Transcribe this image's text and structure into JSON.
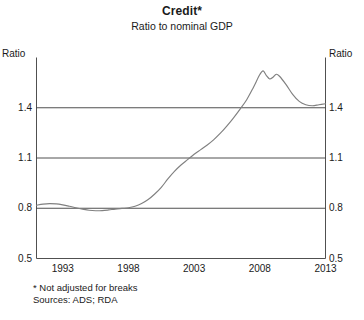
{
  "chart_data": {
    "type": "line",
    "title": "Credit*",
    "subtitle": "Ratio to nominal GDP",
    "xlabel": "",
    "ylabel": "Ratio",
    "ylabel_right": "Ratio",
    "xlim": [
      1991,
      2013
    ],
    "ylim": [
      0.5,
      1.7
    ],
    "yticks": [
      0.5,
      0.8,
      1.1,
      1.4
    ],
    "ytick_labels": [
      "0.5",
      "0.8",
      "1.1",
      "1.4"
    ],
    "xticks": [
      1993,
      1998,
      2003,
      2008,
      2013
    ],
    "xtick_labels": [
      "1993",
      "1998",
      "2003",
      "2008",
      "2013"
    ],
    "grid": "horizontal",
    "legend": "none",
    "line_color": "#808080",
    "axis_color": "#3c3c3c",
    "series": [
      {
        "name": "Credit to nominal GDP",
        "x": [
          1991.0,
          1991.5,
          1992.0,
          1992.5,
          1993.0,
          1993.5,
          1994.0,
          1994.5,
          1995.0,
          1995.5,
          1996.0,
          1996.5,
          1997.0,
          1997.5,
          1998.0,
          1998.5,
          1999.0,
          1999.5,
          2000.0,
          2000.5,
          2001.0,
          2001.5,
          2002.0,
          2002.5,
          2003.0,
          2003.5,
          2004.0,
          2004.5,
          2005.0,
          2005.5,
          2006.0,
          2006.5,
          2007.0,
          2007.5,
          2008.0,
          2008.25,
          2008.5,
          2008.75,
          2009.0,
          2009.25,
          2009.5,
          2010.0,
          2010.5,
          2011.0,
          2011.5,
          2012.0,
          2012.5,
          2013.0
        ],
        "y": [
          0.818,
          0.825,
          0.828,
          0.826,
          0.82,
          0.812,
          0.803,
          0.795,
          0.788,
          0.785,
          0.786,
          0.79,
          0.795,
          0.799,
          0.803,
          0.812,
          0.828,
          0.852,
          0.885,
          0.925,
          0.975,
          1.02,
          1.058,
          1.09,
          1.122,
          1.15,
          1.178,
          1.21,
          1.248,
          1.292,
          1.34,
          1.392,
          1.448,
          1.52,
          1.598,
          1.62,
          1.592,
          1.572,
          1.582,
          1.6,
          1.588,
          1.538,
          1.48,
          1.438,
          1.418,
          1.412,
          1.418,
          1.424
        ]
      }
    ],
    "footnotes": [
      "* Not adjusted for breaks",
      "Sources: ADS; RDA"
    ]
  }
}
